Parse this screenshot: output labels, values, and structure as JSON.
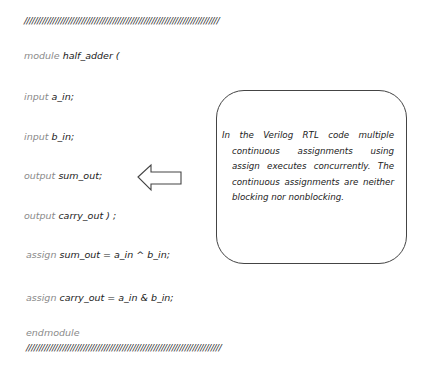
{
  "header_rule": "///////////////////////////////////////////////////////////////////////////",
  "footer_rule": "///////////////////////////////////////////////////////////////////////////",
  "code": {
    "module_line": {
      "keyword": "module",
      "rest": "half_adder ("
    },
    "input_a": {
      "keyword": "input",
      "rest": "a_in;"
    },
    "input_b": {
      "keyword": "input",
      "rest": "b_in;"
    },
    "output_sum": {
      "keyword": "output",
      "rest": "sum_out;"
    },
    "output_carry": {
      "keyword": "output",
      "rest": "carry_out ) ;"
    },
    "assign_sum": {
      "keyword": "assign",
      "rest": "sum_out = a_in ^ b_in;"
    },
    "assign_carry": {
      "keyword": "assign",
      "rest": "carry_out = a_in & b_in;"
    },
    "end_line": {
      "keyword": "endmodule"
    }
  },
  "note": {
    "first_line": "In the Verilog RTL code multiple",
    "body": "continuous assignments using assign executes concurrently. The continuous assignments are neither blocking nor nonblocking."
  },
  "arrow": {
    "direction": "left",
    "icon": "left-arrow-icon"
  }
}
